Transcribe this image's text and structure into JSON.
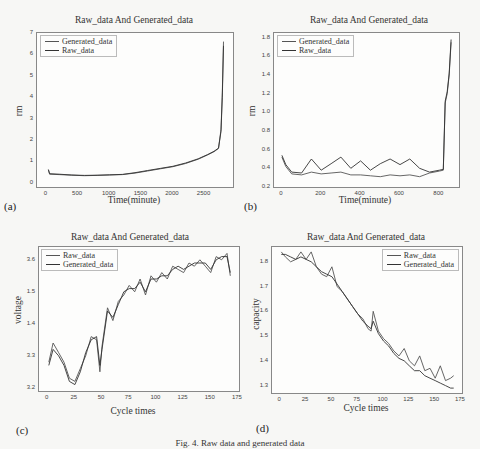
{
  "figure": {
    "caption": "Fig. 4. Raw data and generated data",
    "colors": {
      "raw": "#555555",
      "generated": "#333333",
      "axis": "#888888",
      "background": "#f7f7f5"
    }
  },
  "panels": [
    {
      "label": "(a)",
      "title": "Raw_data And Generated_data",
      "xlabel": "Time(minute)",
      "ylabel": "rm",
      "legend": [
        "Generated_data",
        "Raw_data"
      ],
      "xticks": [
        "0",
        "500",
        "1000",
        "1500",
        "2000",
        "2500"
      ],
      "yticks": [
        "0",
        "1",
        "2",
        "3",
        "4",
        "5",
        "6",
        "7"
      ]
    },
    {
      "label": "(b)",
      "title": "Raw_data And Generated_data",
      "xlabel": "Time(minute)",
      "ylabel": "rm",
      "legend": [
        "Generated_data",
        "Raw_data"
      ],
      "xticks": [
        "0",
        "200",
        "400",
        "600",
        "800"
      ],
      "yticks": [
        "0.2",
        "0.4",
        "0.6",
        "0.8",
        "1.0",
        "1.2",
        "1.4",
        "1.6",
        "1.8"
      ]
    },
    {
      "label": "(c)",
      "title": "Raw_data And Generated_data",
      "xlabel": "Cycle times",
      "ylabel": "voltage",
      "legend": [
        "Raw_data",
        "Generated_data"
      ],
      "xticks": [
        "0",
        "25",
        "50",
        "75",
        "100",
        "125",
        "150",
        "175"
      ],
      "yticks": [
        "3.2",
        "3.3",
        "1.4",
        "1.5",
        "3.6"
      ]
    },
    {
      "label": "(d)",
      "title": "Raw_data And Generated_data",
      "xlabel": "Cycle times",
      "ylabel": "capacity",
      "legend": [
        "Raw_data",
        "Generated_data"
      ],
      "xticks": [
        "0",
        "25",
        "50",
        "75",
        "100",
        "125",
        "150",
        "175"
      ],
      "yticks": [
        "1.3",
        "1.4",
        "1.5",
        "1.6",
        "1.7",
        "1.8"
      ]
    }
  ],
  "chart_data": [
    {
      "type": "line",
      "title": "Raw_data And Generated_data",
      "xlabel": "Time(minute)",
      "ylabel": "rm",
      "xlim": [
        -150,
        2950
      ],
      "ylim": [
        -0.2,
        7
      ],
      "grid": false,
      "legend_position": "upper left",
      "series": [
        {
          "name": "Generated_data",
          "x": [
            30,
            50,
            200,
            400,
            600,
            800,
            1000,
            1200,
            1400,
            1600,
            1800,
            2000,
            2200,
            2400,
            2550,
            2650,
            2720,
            2760,
            2780,
            2800
          ],
          "values": [
            0.6,
            0.4,
            0.38,
            0.35,
            0.33,
            0.34,
            0.36,
            0.38,
            0.45,
            0.55,
            0.65,
            0.75,
            0.9,
            1.1,
            1.3,
            1.45,
            1.6,
            2.5,
            4.2,
            6.6
          ]
        },
        {
          "name": "Raw_data",
          "x": [
            30,
            50,
            200,
            400,
            600,
            800,
            1000,
            1200,
            1400,
            1600,
            1800,
            2000,
            2200,
            2400,
            2550,
            2650,
            2720,
            2760,
            2780,
            2800
          ],
          "values": [
            0.62,
            0.42,
            0.4,
            0.36,
            0.34,
            0.35,
            0.37,
            0.39,
            0.47,
            0.57,
            0.67,
            0.77,
            0.92,
            1.12,
            1.32,
            1.47,
            1.62,
            2.4,
            4.0,
            6.4
          ]
        }
      ]
    },
    {
      "type": "line",
      "title": "Raw_data And Generated_data",
      "xlabel": "Time(minute)",
      "ylabel": "rm",
      "xlim": [
        -40,
        900
      ],
      "ylim": [
        0.2,
        1.85
      ],
      "grid": false,
      "legend_position": "upper left",
      "series": [
        {
          "name": "Generated_data",
          "x": [
            0,
            20,
            50,
            100,
            150,
            200,
            250,
            300,
            350,
            400,
            450,
            500,
            550,
            600,
            650,
            700,
            750,
            800,
            820,
            830,
            840,
            850,
            860
          ],
          "values": [
            0.52,
            0.42,
            0.34,
            0.33,
            0.36,
            0.34,
            0.35,
            0.36,
            0.33,
            0.33,
            0.32,
            0.31,
            0.33,
            0.32,
            0.33,
            0.31,
            0.35,
            0.37,
            0.38,
            1.1,
            1.2,
            1.4,
            1.75
          ]
        },
        {
          "name": "Raw_data",
          "x": [
            0,
            20,
            50,
            100,
            150,
            200,
            250,
            300,
            350,
            400,
            450,
            500,
            550,
            600,
            650,
            700,
            750,
            800,
            820,
            830,
            840,
            850,
            860
          ],
          "values": [
            0.54,
            0.44,
            0.36,
            0.35,
            0.5,
            0.38,
            0.45,
            0.52,
            0.4,
            0.48,
            0.38,
            0.45,
            0.5,
            0.44,
            0.5,
            0.4,
            0.36,
            0.38,
            0.39,
            1.12,
            1.22,
            1.42,
            1.78
          ]
        }
      ]
    },
    {
      "type": "line",
      "title": "Raw_data And Generated_data",
      "xlabel": "Cycle times",
      "ylabel": "voltage",
      "xlim": [
        -8,
        176
      ],
      "ylim": [
        3.19,
        3.64
      ],
      "grid": false,
      "legend_position": "upper left",
      "series": [
        {
          "name": "Raw_data",
          "x": [
            1,
            5,
            10,
            15,
            20,
            25,
            30,
            35,
            40,
            45,
            48,
            50,
            55,
            60,
            65,
            70,
            75,
            80,
            85,
            90,
            95,
            100,
            105,
            110,
            115,
            120,
            125,
            130,
            135,
            140,
            145,
            150,
            155,
            160,
            165,
            168
          ],
          "values": [
            3.28,
            3.34,
            3.31,
            3.28,
            3.23,
            3.22,
            3.26,
            3.3,
            3.36,
            3.35,
            3.25,
            3.33,
            3.45,
            3.41,
            3.47,
            3.49,
            3.52,
            3.5,
            3.54,
            3.49,
            3.55,
            3.53,
            3.56,
            3.54,
            3.58,
            3.57,
            3.56,
            3.59,
            3.58,
            3.6,
            3.58,
            3.56,
            3.61,
            3.6,
            3.62,
            3.55
          ]
        },
        {
          "name": "Generated_data",
          "x": [
            1,
            5,
            10,
            15,
            20,
            25,
            30,
            35,
            40,
            45,
            48,
            50,
            55,
            60,
            65,
            70,
            75,
            80,
            85,
            90,
            95,
            100,
            105,
            110,
            115,
            120,
            125,
            130,
            135,
            140,
            145,
            150,
            155,
            160,
            165,
            168
          ],
          "values": [
            3.27,
            3.32,
            3.3,
            3.27,
            3.22,
            3.21,
            3.25,
            3.31,
            3.35,
            3.36,
            3.27,
            3.32,
            3.44,
            3.42,
            3.46,
            3.5,
            3.51,
            3.51,
            3.53,
            3.5,
            3.54,
            3.54,
            3.55,
            3.55,
            3.57,
            3.58,
            3.57,
            3.58,
            3.59,
            3.59,
            3.59,
            3.57,
            3.6,
            3.61,
            3.61,
            3.56
          ]
        }
      ]
    },
    {
      "type": "line",
      "title": "Raw_data And Generated_data",
      "xlabel": "Cycle times",
      "ylabel": "capacity",
      "xlim": [
        -8,
        176
      ],
      "ylim": [
        1.27,
        1.86
      ],
      "grid": false,
      "legend_position": "upper right",
      "series": [
        {
          "name": "Raw_data",
          "x": [
            1,
            5,
            10,
            15,
            20,
            25,
            30,
            35,
            40,
            45,
            50,
            55,
            60,
            65,
            70,
            75,
            80,
            85,
            88,
            90,
            95,
            100,
            105,
            110,
            115,
            120,
            125,
            130,
            135,
            140,
            145,
            150,
            155,
            160,
            165,
            168
          ],
          "values": [
            1.84,
            1.82,
            1.8,
            1.81,
            1.84,
            1.81,
            1.84,
            1.78,
            1.75,
            1.74,
            1.78,
            1.7,
            1.68,
            1.65,
            1.62,
            1.59,
            1.57,
            1.53,
            1.52,
            1.6,
            1.52,
            1.49,
            1.47,
            1.44,
            1.42,
            1.45,
            1.4,
            1.38,
            1.42,
            1.36,
            1.37,
            1.33,
            1.38,
            1.32,
            1.33,
            1.34
          ]
        },
        {
          "name": "Generated_data",
          "x": [
            1,
            5,
            10,
            15,
            20,
            25,
            30,
            35,
            40,
            45,
            50,
            55,
            60,
            65,
            70,
            75,
            80,
            85,
            88,
            90,
            95,
            100,
            105,
            110,
            115,
            120,
            125,
            130,
            135,
            140,
            145,
            150,
            155,
            160,
            165,
            168
          ],
          "values": [
            1.83,
            1.83,
            1.82,
            1.81,
            1.82,
            1.81,
            1.8,
            1.78,
            1.76,
            1.75,
            1.74,
            1.71,
            1.68,
            1.65,
            1.62,
            1.59,
            1.56,
            1.54,
            1.53,
            1.56,
            1.51,
            1.48,
            1.46,
            1.43,
            1.41,
            1.4,
            1.38,
            1.36,
            1.36,
            1.34,
            1.33,
            1.32,
            1.31,
            1.3,
            1.29,
            1.29
          ]
        }
      ]
    }
  ]
}
